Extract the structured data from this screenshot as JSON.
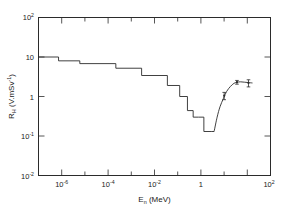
{
  "figure": {
    "background_color": "#ffffff",
    "line_color": "#2b2b2b"
  },
  "chart_data": {
    "type": "line",
    "title": "",
    "subtitle": "",
    "xlabel": "E_n (MeV)",
    "xlabel_base": "E",
    "xlabel_sub": "n",
    "xlabel_unit": " (MeV)",
    "ylabel": "R_H (V.mSv^-1)",
    "ylabel_base": "R",
    "ylabel_sub": "H",
    "ylabel_unit_pre": " (V.mSv",
    "ylabel_unit_sup": "-1",
    "ylabel_unit_post": ")",
    "xscale": "log",
    "yscale": "log",
    "xlim": [
      1e-07,
      100
    ],
    "ylim": [
      0.01,
      100
    ],
    "grid": false,
    "legend": "none",
    "xticks_major": [
      1e-06,
      0.0001,
      0.01,
      1,
      100
    ],
    "xtick_labels": [
      "10-6",
      "10-4",
      "10-2",
      "1",
      "102"
    ],
    "xtick_label_parts": [
      {
        "base": "10",
        "sup": "-6"
      },
      {
        "base": "10",
        "sup": "-4"
      },
      {
        "base": "10",
        "sup": "-2"
      },
      {
        "base": "1",
        "sup": ""
      },
      {
        "base": "10",
        "sup": "2"
      }
    ],
    "xticks_minor": [
      1e-07,
      1e-05,
      0.001,
      0.1,
      10
    ],
    "yticks_major": [
      100,
      10,
      1,
      0.1,
      0.01
    ],
    "ytick_label_parts": [
      {
        "base": "10",
        "sup": "2"
      },
      {
        "base": "10",
        "sup": ""
      },
      {
        "base": "1",
        "sup": ""
      },
      {
        "base": "10",
        "sup": "-1"
      },
      {
        "base": "10",
        "sup": "-2"
      }
    ],
    "series": [
      {
        "name": "Calculated response (staircase)",
        "style": "step",
        "x": [
          1e-07,
          6e-07,
          6e-07,
          4e-06,
          4e-06,
          0.0001,
          0.0001,
          0.001,
          0.001,
          0.01,
          0.01,
          0.03,
          0.03,
          0.06,
          0.06,
          0.1,
          0.1,
          0.16,
          0.16,
          0.26,
          0.26,
          0.5,
          0.5,
          0.65
        ],
        "y": [
          10.0,
          10.0,
          8.0,
          8.0,
          6.8,
          6.8,
          5.2,
          5.2,
          3.4,
          3.4,
          1.9,
          1.9,
          1.0,
          1.0,
          0.44,
          0.44,
          0.3,
          0.3,
          0.3,
          0.3,
          0.13,
          0.13,
          0.13,
          0.13
        ]
      },
      {
        "name": "Measured response (rising branch)",
        "style": "smooth",
        "x": [
          0.65,
          0.85,
          1.1,
          1.5,
          2.0,
          2.8,
          3.8,
          5.0,
          7.0,
          10.0,
          14.0,
          20.0
        ],
        "y": [
          0.13,
          0.3,
          0.55,
          0.9,
          1.35,
          1.8,
          2.15,
          2.3,
          2.35,
          2.3,
          2.25,
          2.2
        ]
      }
    ],
    "data_points": [
      {
        "x": 1.6,
        "y": 1.05,
        "yerr": 0.22,
        "marker": "point-with-error-bar"
      },
      {
        "x": 5.0,
        "y": 2.3,
        "yerr": 0.25,
        "marker": "point-with-error-bar"
      },
      {
        "x": 14.0,
        "y": 2.2,
        "yerr": 0.45,
        "marker": "point-with-error-bar"
      }
    ],
    "annotations": []
  }
}
